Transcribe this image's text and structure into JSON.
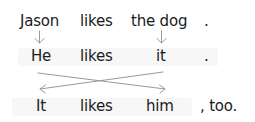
{
  "diagram": {
    "type": "pronoun-substitution",
    "rows": [
      {
        "id": "row1",
        "words": [
          "Jason",
          "likes",
          "the dog",
          "."
        ]
      },
      {
        "id": "row2",
        "words": [
          "He",
          "likes",
          "it",
          "."
        ]
      },
      {
        "id": "row3",
        "words": [
          "It",
          "likes",
          "him",
          ", too."
        ]
      }
    ],
    "arrows": [
      {
        "from": "Jason",
        "to": "He",
        "style": "straight-down"
      },
      {
        "from": "the dog",
        "to": "it",
        "style": "straight-down"
      },
      {
        "from": "He",
        "to": "him",
        "style": "diagonal-cross"
      },
      {
        "from": "it",
        "to": "It",
        "style": "diagonal-cross"
      }
    ],
    "colors": {
      "text": "#1a1a1a",
      "arrow": "#999999",
      "box": "#f7f7f7"
    }
  }
}
